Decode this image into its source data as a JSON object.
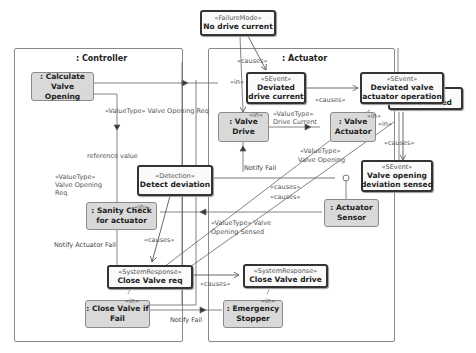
{
  "frames": {
    "controller": {
      "title": ": Controller"
    },
    "actuator": {
      "title": ": Actuator"
    }
  },
  "parts": {
    "calculate_valve_opening": {
      "label": ": Calculate Valve Opening"
    },
    "sanity_check": {
      "label": ": Sanity Check for actuator"
    },
    "close_valve_if_fail": {
      "label": ": Close Valve if Fail"
    },
    "valve_drive": {
      "label": ": Valve Drive"
    },
    "valve_actuator": {
      "label": ": Valve Actuator"
    },
    "actuator_sensor": {
      "label": ": Actuator Sensor"
    },
    "emergency_stopper": {
      "label": ": Emergency Stopper"
    }
  },
  "events": {
    "no_drive_current": {
      "stereotype": "«FailureMode»",
      "name": "No drive current"
    },
    "deviated_drive_current": {
      "stereotype": "«SEvent»",
      "name_line1": "Deviated",
      "name_line2": "drive current"
    },
    "deviated_valve_actuator_operation": {
      "stereotype": "«SEvent»",
      "name_line1": "Deviated valve",
      "name_line2": "actuator operation"
    },
    "valve_closed": {
      "stereotype": "«SEvent»",
      "name": "Valve closed"
    },
    "valve_opening_deviation_sensed": {
      "stereotype": "«SEvent»",
      "name_line1": "Valve opening",
      "name_line2": "deviation sensed"
    },
    "detect_deviation": {
      "stereotype": "«Detection»",
      "name": "Detect deviation"
    },
    "close_valve_req": {
      "stereotype": "«SystemResponse»",
      "name": "Close Valve req"
    },
    "close_valve_drive": {
      "stereotype": "«SystemResponse»",
      "name": "Close Valve drive"
    }
  },
  "labels": {
    "causes": "«causes»",
    "in": "«in»",
    "vt_valve_opening_req": "«ValueType» Valve Opening Req",
    "vt_drive_current_1": "«ValueType»",
    "vt_drive_current_2": "Drive Current",
    "reference_value": "reference value",
    "vt_req_1": "«ValueType»",
    "vt_req_2": "Valve Opening",
    "vt_req_3": "Req",
    "notify_fail": "Notify Fail",
    "vt_valve_opening_1": "«ValueType»",
    "vt_valve_opening_2": "Valve Opening",
    "vt_sensed_1": "«ValueType» Valve",
    "vt_sensed_2": "Opening Sensed",
    "notify_actuator_fail": "Notify Actuator Fail",
    "notify_fail_bottom": "Notify Fail"
  }
}
